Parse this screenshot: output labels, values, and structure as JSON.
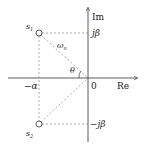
{
  "diagram": {
    "axes": {
      "x_label": "Re",
      "y_label": "Im",
      "origin_label": "0"
    },
    "points": [
      {
        "name": "s1",
        "label": "s",
        "sub": "1"
      },
      {
        "name": "s2",
        "label": "s",
        "sub": "2"
      }
    ],
    "labels": {
      "imag_pos": "jβ",
      "imag_neg": "−jβ",
      "real_neg": "−α",
      "radius": "ω",
      "radius_sub": "n",
      "angle": "θ"
    }
  }
}
